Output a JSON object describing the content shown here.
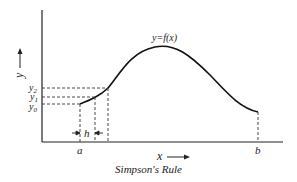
{
  "figure": {
    "caption": "Simpson's Rule",
    "curve_label": "y=f(x)",
    "axis_labels": {
      "x": "x",
      "y": "y"
    },
    "ordinate_labels": [
      "y2",
      "y1",
      "y0"
    ],
    "x_tick_labels": {
      "start": "a",
      "end": "b"
    },
    "interval_label": "h"
  }
}
